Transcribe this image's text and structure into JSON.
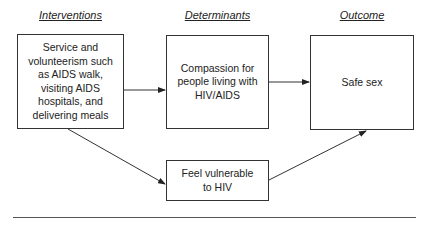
{
  "headers": {
    "interventions": "Interventions",
    "determinants": "Determinants",
    "outcome": "Outcome"
  },
  "nodes": {
    "intervention": "Service and\nvolunteerism such\nas AIDS walk,\nvisiting AIDS\nhospitals, and\ndelivering meals",
    "compassion": "Compassion for\npeople living with\nHIV/AIDS",
    "vulnerable": "Feel vulnerable\nto HIV",
    "outcome": "Safe sex"
  },
  "edges": [
    {
      "from": "intervention",
      "to": "compassion"
    },
    {
      "from": "compassion",
      "to": "outcome"
    },
    {
      "from": "intervention",
      "to": "vulnerable"
    },
    {
      "from": "vulnerable",
      "to": "outcome"
    }
  ]
}
